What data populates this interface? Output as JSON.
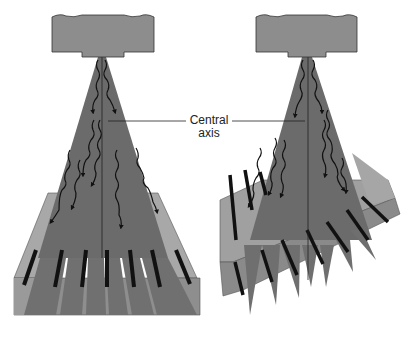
{
  "figure": {
    "label": {
      "line1": "Central",
      "line2": "axis"
    },
    "panels": [
      {
        "name": "left",
        "description": "X-ray tube, divergent beam, focused grid parallel strips"
      },
      {
        "name": "right",
        "description": "X-ray tube, divergent beam, tilted grid with cut-off"
      }
    ]
  },
  "colors": {
    "tube": "#8c8c8c",
    "tube_outline": "#333333",
    "beam": "#6e6e6e",
    "grid_light": "#a3a3a3",
    "grid_side": "#8a8a8a",
    "lead_strip": "#111111",
    "background": "#ffffff"
  }
}
